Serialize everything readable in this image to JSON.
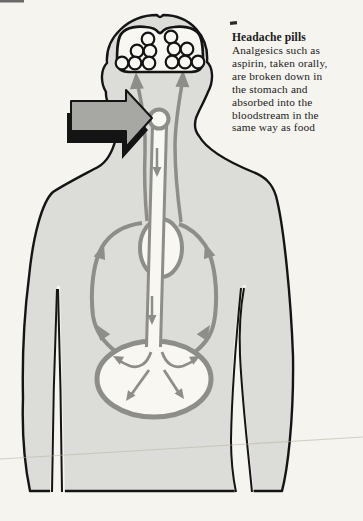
{
  "caption": {
    "title": "Headache pills",
    "lines": [
      "Analgesics such as",
      "aspirin, taken orally,",
      "are broken down in",
      "the stomach and",
      "absorbed into the",
      "bloodstream in the",
      "same way as food"
    ]
  },
  "figure": {
    "parts": [
      "brain-with-pill-particles",
      "pill-entry-arrow",
      "mouth",
      "esophagus",
      "heart",
      "stomach",
      "bloodstream-circulation-arrows"
    ],
    "brain_pill_dots": 12
  },
  "colors": {
    "paper": "#f5f4ef",
    "body": "#dcdcd8",
    "organ_white": "#f8f7f2",
    "vessel_gray": "#8d8d89",
    "arrow_gray": "#a7a7a3",
    "outline_black": "#141414",
    "text": "#1b1b1b"
  }
}
